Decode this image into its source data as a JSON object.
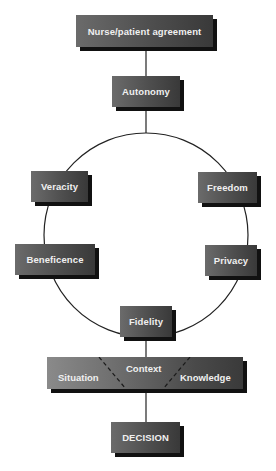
{
  "diagram": {
    "title_box": "Nurse/patient agreement",
    "autonomy": "Autonomy",
    "circle_nodes": {
      "veracity": "Veracity",
      "freedom": "Freedom",
      "beneficence": "Beneficence",
      "privacy": "Privacy",
      "fidelity": "Fidelity"
    },
    "context_bar": {
      "left": "Situation",
      "center": "Context",
      "right": "Knowledge"
    },
    "decision": "DECISION"
  },
  "colors": {
    "box_light": "#6b6b6b",
    "box_dark": "#393939",
    "shadow": "#111111",
    "text": "#f0f0f0",
    "line": "#222222"
  }
}
